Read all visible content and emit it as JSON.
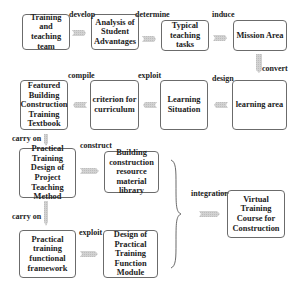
{
  "diagram": {
    "nodes": [
      {
        "id": "n1",
        "label": "Training and teaching team"
      },
      {
        "id": "n2",
        "label": "Analysis of Student Advantages"
      },
      {
        "id": "n3",
        "label": "Typical teaching tasks"
      },
      {
        "id": "n4",
        "label": "Mission Area"
      },
      {
        "id": "n5",
        "label": "learning area"
      },
      {
        "id": "n6",
        "label": "Learning Situation"
      },
      {
        "id": "n7",
        "label": "criterion for curriculum"
      },
      {
        "id": "n8",
        "label": "Featured Building Construction Training Textbook"
      },
      {
        "id": "n9",
        "label": "Practical Training Design of Project Teaching Method"
      },
      {
        "id": "n10",
        "label": "Building construction resource material library"
      },
      {
        "id": "n11",
        "label": "Practical training functional framework"
      },
      {
        "id": "n12",
        "label": "Design of Practical Training Function Module"
      },
      {
        "id": "n13",
        "label": "Virtual Training Course for Construction"
      }
    ],
    "edges": [
      {
        "from": "n1",
        "to": "n2",
        "label": "develop"
      },
      {
        "from": "n2",
        "to": "n3",
        "label": "determine"
      },
      {
        "from": "n3",
        "to": "n4",
        "label": "induce"
      },
      {
        "from": "n4",
        "to": "n5",
        "label": "convert"
      },
      {
        "from": "n5",
        "to": "n6",
        "label": "design"
      },
      {
        "from": "n6",
        "to": "n7",
        "label": "exploit"
      },
      {
        "from": "n7",
        "to": "n8",
        "label": "compile"
      },
      {
        "from": "n8",
        "to": "n9",
        "label": "carry on"
      },
      {
        "from": "n9",
        "to": "n10",
        "label": "construct"
      },
      {
        "from": "n9",
        "to": "n11",
        "label": "carry on"
      },
      {
        "from": "n11",
        "to": "n12",
        "label": "exploit"
      },
      {
        "from": "group",
        "to": "n13",
        "label": "integration"
      }
    ],
    "colors": {
      "arrow": "#c8c8c8",
      "border": "#6b6b6b",
      "text": "#222222"
    }
  }
}
